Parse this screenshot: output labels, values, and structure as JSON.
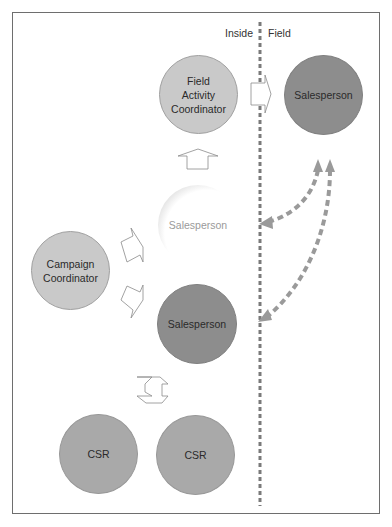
{
  "diagram": {
    "divider": {
      "left_label": "Inside",
      "right_label": "Field"
    },
    "nodes": [
      {
        "id": "field-activity-coordinator",
        "label": "Field\nActivity\nCoordinator",
        "shade": "light"
      },
      {
        "id": "field-salesperson",
        "label": "Salesperson",
        "shade": "dark"
      },
      {
        "id": "ghost-salesperson",
        "label": "Salesperson",
        "shade": "ghost"
      },
      {
        "id": "campaign-coordinator",
        "label": "Campaign\nCoordinator",
        "shade": "light"
      },
      {
        "id": "inside-salesperson",
        "label": "Salesperson",
        "shade": "dark"
      },
      {
        "id": "csr-left",
        "label": "CSR",
        "shade": "medium"
      },
      {
        "id": "csr-right",
        "label": "CSR",
        "shade": "medium"
      }
    ],
    "colors": {
      "light": "#c9c9c9",
      "medium": "#a9a9a9",
      "dark": "#8d8d8d",
      "dashed_line": "#7a7a7a",
      "dashed_arrows": "#9a9a9a",
      "frame": "#6e6e6e"
    }
  }
}
